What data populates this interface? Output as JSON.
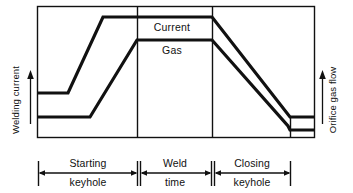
{
  "figure": {
    "background_color": "#ffffff",
    "line_color": "#111111",
    "frame_color": "#111111"
  },
  "axes": {
    "left": {
      "label": "Welding current",
      "arrow_direction": "up",
      "icon": "up-arrow-icon"
    },
    "right": {
      "label": "Orifice gas flow",
      "arrow_direction": "up",
      "icon": "up-arrow-icon"
    }
  },
  "curves": [
    {
      "id": "current",
      "label": "Current",
      "label_x": 172,
      "label_y": 30,
      "stroke_width": 3.2,
      "points": [
        [
          38,
          93
        ],
        [
          68,
          93
        ],
        [
          103,
          17
        ],
        [
          212,
          17
        ],
        [
          290,
          117
        ],
        [
          314,
          117
        ]
      ]
    },
    {
      "id": "gas",
      "label": "Gas",
      "label_x": 172,
      "label_y": 53,
      "stroke_width": 3.2,
      "points": [
        [
          38,
          117
        ],
        [
          90,
          117
        ],
        [
          137,
          40
        ],
        [
          212,
          40
        ],
        [
          288,
          126
        ],
        [
          290,
          130
        ],
        [
          314,
          130
        ]
      ]
    }
  ],
  "frame": {
    "x1": 37,
    "y1": 6,
    "x2": 314,
    "y2": 137
  },
  "dividers": [
    {
      "name": "divider-weld-start",
      "x": 137
    },
    {
      "name": "divider-weld-end",
      "x": 212
    },
    {
      "name": "divider-closing-end",
      "x": 290
    }
  ],
  "spans": [
    {
      "id": "starting-keyhole",
      "line1": "Starting",
      "line2": "keyhole",
      "x_start": 40,
      "x_end": 136,
      "center": 88
    },
    {
      "id": "weld-time",
      "line1": "Weld",
      "line2": "time",
      "x_start": 139,
      "x_end": 210,
      "center": 174
    },
    {
      "id": "closing-keyhole",
      "line1": "Closing",
      "line2": "keyhole",
      "x_start": 215,
      "x_end": 288,
      "center": 251
    }
  ],
  "span_geometry": {
    "arrow_y": 173,
    "tick_top": 161,
    "tick_bottom": 186,
    "line1_y": 167,
    "line2_y": 185
  },
  "chart_data": {
    "type": "line",
    "title": "",
    "xlabel": "",
    "ylabel": "Welding current",
    "y2label": "Orifice gas flow",
    "grid": false,
    "legend": "inline-annotations",
    "x_phases": [
      "Starting keyhole",
      "Weld time",
      "Closing keyhole"
    ],
    "series": [
      {
        "name": "Current",
        "x": [
          "start",
          "pre-ramp",
          "ramp-top",
          "weld-end",
          "ramp-down-end",
          "finish"
        ],
        "values": [
          34,
          34,
          92,
          92,
          15,
          15
        ],
        "units": "relative",
        "note": "Low pilot level, ramps up to full welding current during starting keyhole, holds through weld time, ramps down during closing keyhole to a low level."
      },
      {
        "name": "Gas",
        "x": [
          "start",
          "pre-ramp",
          "ramp-top",
          "weld-end",
          "ramp-down-end",
          "step",
          "finish"
        ],
        "values": [
          15,
          15,
          74,
          74,
          8,
          5,
          5
        ],
        "units": "relative",
        "note": "Low orifice gas flow, ramps up later than current, holds through weld time, ramps down during closing keyhole with a final step to minimum."
      }
    ]
  }
}
